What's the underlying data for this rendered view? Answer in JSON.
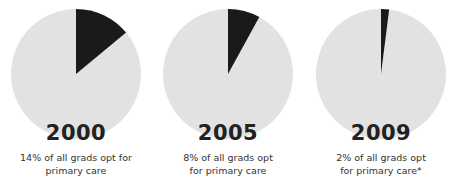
{
  "chart_data": {
    "type": "pie",
    "title": "",
    "colors": {
      "slice": "#1a1a1a",
      "remainder": "#e2e2e2"
    },
    "charts": [
      {
        "year": "2000",
        "primary_care_pct": 14,
        "other_pct": 86,
        "caption_lines": [
          "14% of all grads opt for",
          "primary care"
        ]
      },
      {
        "year": "2005",
        "primary_care_pct": 8,
        "other_pct": 92,
        "caption_lines": [
          "8% of all grads opt",
          "for primary care"
        ]
      },
      {
        "year": "2009",
        "primary_care_pct": 2,
        "other_pct": 98,
        "caption_lines": [
          "2% of all grads opt",
          "for primary care*"
        ]
      }
    ]
  }
}
